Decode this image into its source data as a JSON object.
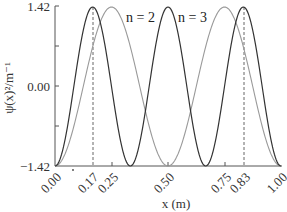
{
  "chart_data": {
    "type": "line",
    "title": "",
    "xlabel": "x (m)",
    "ylabel": "ψ(x)²/m⁻¹",
    "xlim": [
      0.0,
      1.0
    ],
    "ylim": [
      -1.42,
      1.42
    ],
    "grid": false,
    "legend_position": "inline-annotations",
    "x_ticks": [
      "0.00",
      "0.17",
      "0.25",
      "0.50",
      "0.75",
      "0.83",
      "1.00"
    ],
    "y_ticks": [
      "-1.42",
      "0.00",
      "1.42"
    ],
    "dashed_verticals": [
      0.17,
      0.83
    ],
    "series": [
      {
        "name": "n = 2",
        "color": "#9a9a9a",
        "function": "sin^2(2πx) scaled from -1.42 to 1.42",
        "x": [
          0.0,
          0.125,
          0.25,
          0.375,
          0.5,
          0.625,
          0.75,
          0.875,
          1.0
        ],
        "values": [
          -1.42,
          0.0,
          1.42,
          0.0,
          -1.42,
          0.0,
          1.42,
          0.0,
          -1.42
        ]
      },
      {
        "name": "n = 3",
        "color": "#333333",
        "function": "sin^2(3πx) scaled from -1.42 to 1.42",
        "x": [
          0.0,
          0.0833,
          0.1667,
          0.25,
          0.3333,
          0.4167,
          0.5,
          0.5833,
          0.6667,
          0.75,
          0.8333,
          0.9167,
          1.0
        ],
        "values": [
          -1.42,
          0.0,
          1.42,
          0.0,
          -1.42,
          0.0,
          1.42,
          0.0,
          -1.42,
          0.0,
          1.42,
          0.0,
          -1.42
        ]
      }
    ],
    "annotations": [
      {
        "text": "n = 2",
        "x": 0.33,
        "y": 1.2
      },
      {
        "text": "n = 3",
        "x": 0.56,
        "y": 1.2
      }
    ]
  },
  "labels": {
    "xlabel": "x (m)",
    "ylabel": "ψ(x)²/m⁻¹",
    "y_top": "1.42",
    "y_mid": "0.00",
    "y_bottom": "−1.42",
    "x0": "0.00",
    "x017": "0.17",
    "x025": "0.25",
    "x050": "0.50",
    "x075": "0.75",
    "x083": "0.83",
    "x100": "1.00",
    "n2": "n = 2",
    "n3": "n = 3"
  }
}
